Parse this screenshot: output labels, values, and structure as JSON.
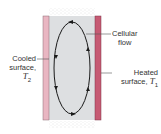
{
  "diagram": {
    "labels": {
      "cellular_flow": [
        "Cellular",
        "flow"
      ],
      "cooled": {
        "line1": "Cooled",
        "line2": "surface,",
        "symbol": "T",
        "subscript": "2"
      },
      "heated": {
        "line1": "Heated",
        "line2": "surface, ",
        "symbol": "T",
        "subscript": "1"
      }
    },
    "colors": {
      "cooled_wall": "#e9b6c2",
      "heated_wall": "#c65a73",
      "fluid": "#dddfe1",
      "loop": "#1a1a1a",
      "stipple": "#bfbfbf"
    }
  }
}
